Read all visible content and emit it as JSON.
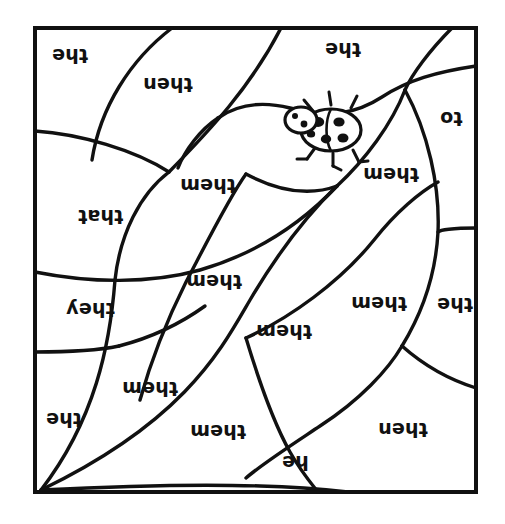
{
  "page": {
    "orientation": "rotated-180",
    "background_color": "#ffffff",
    "ink_color": "#111111",
    "border": {
      "x": 33,
      "y": 26,
      "width": 445,
      "height": 468,
      "stroke_width": 4
    }
  },
  "illustration": {
    "name": "ladybug",
    "description": "ladybug drawing with spotted oval body, head, antennae and legs",
    "x": 292,
    "y": 92,
    "width": 86,
    "height": 72
  },
  "regions": [
    {
      "id": "r1",
      "word": "the",
      "x": 52,
      "y": 46,
      "font_size": 19
    },
    {
      "id": "r2",
      "word": "then",
      "x": 143,
      "y": 75,
      "font_size": 19
    },
    {
      "id": "r3",
      "word": "the",
      "x": 325,
      "y": 40,
      "font_size": 19
    },
    {
      "id": "r4",
      "word": "to",
      "x": 440,
      "y": 109,
      "font_size": 19
    },
    {
      "id": "r5",
      "word": "them",
      "x": 180,
      "y": 176,
      "font_size": 19
    },
    {
      "id": "r6",
      "word": "them",
      "x": 363,
      "y": 165,
      "font_size": 19
    },
    {
      "id": "r7",
      "word": "that",
      "x": 78,
      "y": 207,
      "font_size": 19
    },
    {
      "id": "r8",
      "word": "them",
      "x": 186,
      "y": 272,
      "font_size": 19
    },
    {
      "id": "r9",
      "word": "they",
      "x": 66,
      "y": 300,
      "font_size": 19
    },
    {
      "id": "r10",
      "word": "them",
      "x": 351,
      "y": 294,
      "font_size": 19
    },
    {
      "id": "r11",
      "word": "the",
      "x": 437,
      "y": 295,
      "font_size": 19
    },
    {
      "id": "r12",
      "word": "them",
      "x": 256,
      "y": 322,
      "font_size": 19
    },
    {
      "id": "r13",
      "word": "them",
      "x": 122,
      "y": 379,
      "font_size": 19
    },
    {
      "id": "r14",
      "word": "the",
      "x": 46,
      "y": 410,
      "font_size": 19
    },
    {
      "id": "r15",
      "word": "them",
      "x": 190,
      "y": 422,
      "font_size": 19
    },
    {
      "id": "r16",
      "word": "then",
      "x": 378,
      "y": 420,
      "font_size": 19
    },
    {
      "id": "r17",
      "word": "he",
      "x": 282,
      "y": 453,
      "font_size": 19
    }
  ],
  "word_list": [
    "the",
    "then",
    "them",
    "that",
    "they",
    "to",
    "he"
  ]
}
